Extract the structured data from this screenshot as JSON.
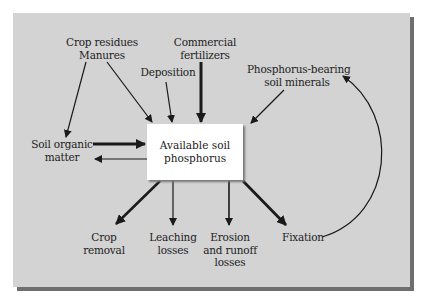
{
  "diagram": {
    "center": {
      "line1": "Available soil",
      "line2": "phosphorus"
    },
    "sources": [
      {
        "id": "crop-residues",
        "line1": "Crop residues",
        "line2": "Manures"
      },
      {
        "id": "deposition",
        "line1": "Deposition"
      },
      {
        "id": "commercial-fertilizers",
        "line1": "Commercial",
        "line2": "fertilizers"
      },
      {
        "id": "phosphorus-minerals",
        "line1": "Phosphorus-bearing",
        "line2": "soil minerals"
      },
      {
        "id": "soil-organic-matter",
        "line1": "Soil organic",
        "line2": "matter"
      }
    ],
    "sinks": [
      {
        "id": "crop-removal",
        "line1": "Crop",
        "line2": "removal"
      },
      {
        "id": "leaching",
        "line1": "Leaching",
        "line2": "losses"
      },
      {
        "id": "erosion",
        "line1": "Erosion",
        "line2": "and runoff",
        "line3": "losses"
      },
      {
        "id": "fixation",
        "line1": "Fixation"
      }
    ],
    "colors": {
      "panel": "#d3d3d3",
      "shadow": "#6e6e6e",
      "box": "#ffffff",
      "arrow": "#1a1a1a"
    }
  }
}
